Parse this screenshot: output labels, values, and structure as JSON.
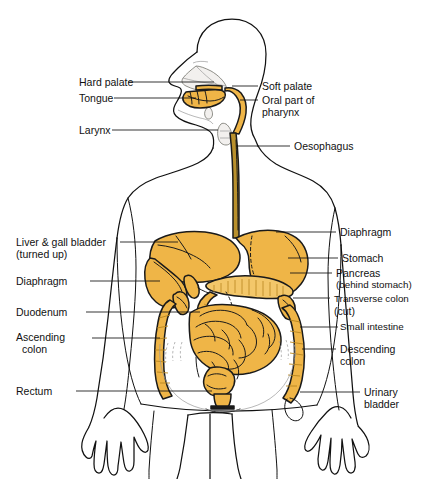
{
  "figure": {
    "view": "anterior body outline with head in left profile",
    "colors": {
      "organ_fill": "#EFB547",
      "organ_fill_light": "#F3C76A",
      "organ_fill_dark": "#E2A02F",
      "oesophagus_fill": "#B9902C",
      "outline_stroke": "#111111",
      "background": "#FFFFFF",
      "head_shade": "#F2F0EE"
    }
  },
  "labels_left": [
    {
      "id": "hard-palate",
      "text": "Hard palate",
      "text2": ""
    },
    {
      "id": "tongue",
      "text": "Tongue",
      "text2": ""
    },
    {
      "id": "larynx",
      "text": "Larynx",
      "text2": ""
    },
    {
      "id": "liver",
      "text": "Liver & gall bladder",
      "text2": "(turned up)"
    },
    {
      "id": "diaphragm-l",
      "text": "Diaphragm",
      "text2": ""
    },
    {
      "id": "duodenum",
      "text": "Duodenum",
      "text2": ""
    },
    {
      "id": "ascending-colon",
      "text": "Ascending",
      "text2": "colon"
    },
    {
      "id": "rectum",
      "text": "Rectum",
      "text2": ""
    }
  ],
  "labels_right": [
    {
      "id": "soft-palate",
      "text": "Soft palate",
      "text2": ""
    },
    {
      "id": "oral-pharynx",
      "text": "Oral part of",
      "text2": "pharynx"
    },
    {
      "id": "oesophagus",
      "text": "Oesophagus",
      "text2": ""
    },
    {
      "id": "diaphragm-r",
      "text": "Diaphragm",
      "text2": ""
    },
    {
      "id": "stomach",
      "text": "Stomach",
      "text2": ""
    },
    {
      "id": "pancreas",
      "text": "Pancreas",
      "text2": "(behind stomach)"
    },
    {
      "id": "transverse-colon",
      "text": "Transverse colon",
      "text2": "(cut)"
    },
    {
      "id": "small-intestine",
      "text": "Small intestine",
      "text2": ""
    },
    {
      "id": "descending-colon",
      "text": "Descending",
      "text2": "colon"
    },
    {
      "id": "urinary-bladder",
      "text": "Urinary",
      "text2": "bladder"
    }
  ]
}
